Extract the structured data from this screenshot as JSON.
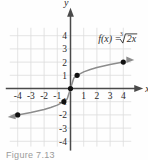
{
  "figure": {
    "caption": "Figure 7.13",
    "function_label": "f(x) =",
    "radical_index": "3",
    "radicand": "2x",
    "axis_x_label": "x",
    "axis_y_label": "y",
    "colors": {
      "grid": "#dcdcdc",
      "axis": "#4a4a4a",
      "curve": "#8c8c8c",
      "point": "#111111",
      "text": "#2b2b2b",
      "caption": "#9a9a9a",
      "background": "#fefefe"
    }
  },
  "chart_data": {
    "type": "line",
    "title": "",
    "xlabel": "x",
    "ylabel": "y",
    "xlim": [
      -4.6,
      4.6
    ],
    "ylim": [
      -4.4,
      4.6
    ],
    "grid": true,
    "legend": null,
    "xticks": [
      -4,
      -3,
      -2,
      -1,
      1,
      2,
      3,
      4
    ],
    "xticklabels": [
      "-4",
      "-3",
      "-2",
      "-1",
      "1",
      "2",
      "3",
      "4"
    ],
    "yticks": [
      4,
      3,
      2,
      1,
      -1,
      -2,
      -3,
      -4
    ],
    "yticklabels": [
      "4",
      "3",
      "2",
      "1",
      "-1",
      "-2",
      "-3",
      "-4"
    ],
    "annotations": [
      {
        "text": "f(x) = ∛2x",
        "x": 2.1,
        "y": 3.5
      }
    ],
    "series": [
      {
        "name": "f(x) = cube root of 2x",
        "arrow_start": true,
        "arrow_end": true,
        "x": [
          -4.0,
          -3.5,
          -3.0,
          -2.5,
          -2.0,
          -1.5,
          -1.0,
          -0.5,
          -0.25,
          0.0,
          0.25,
          0.5,
          1.0,
          1.5,
          2.0,
          2.5,
          3.0,
          3.5,
          4.0
        ],
        "y": [
          -2.0,
          -1.91,
          -1.82,
          -1.71,
          -1.59,
          -1.44,
          -1.26,
          -1.0,
          -0.79,
          0.0,
          0.79,
          1.0,
          1.26,
          1.44,
          1.59,
          1.71,
          1.82,
          1.91,
          2.0
        ]
      }
    ],
    "points": [
      {
        "label": "(-4, -2)",
        "x": -4,
        "y": -2
      },
      {
        "label": "(-0.5, -1)",
        "x": -0.5,
        "y": -1
      },
      {
        "label": "(0, 0)",
        "x": 0,
        "y": 0
      },
      {
        "label": "(0.5, 1)",
        "x": 0.5,
        "y": 1
      },
      {
        "label": "(4, 2)",
        "x": 4,
        "y": 2
      }
    ]
  }
}
